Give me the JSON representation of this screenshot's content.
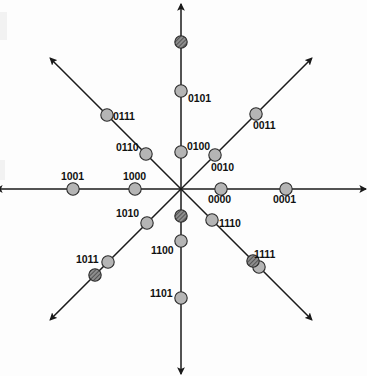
{
  "figure": {
    "kind": "constellation-diagram",
    "title": "",
    "background_color": "#fdfdfd",
    "axis_color": "#1a1a1a",
    "point_fill_light": "#b5b5b5",
    "point_fill_dark": "#6e6e6e",
    "point_stroke": "#2a2a2a",
    "label_color": "#111111",
    "center": {
      "x": 181,
      "y": 189
    },
    "ray_count": 8,
    "ray_angles_deg": [
      0,
      45,
      90,
      135,
      180,
      225,
      270,
      315
    ],
    "ray_length_px": 185
  },
  "chart_data": {
    "type": "scatter",
    "title": "",
    "xlabel": "",
    "ylabel": "",
    "grid": false,
    "legend": null,
    "axis_style": "eight-ray-star-with-arrowheads",
    "points": [
      {
        "label": "0001",
        "angle_deg": 0,
        "radius": 105,
        "x": 286,
        "y": 189,
        "shade": "light",
        "label_dx": -13,
        "label_dy": 11
      },
      {
        "label": "0000",
        "angle_deg": 0,
        "radius": 40,
        "x": 221,
        "y": 189,
        "shade": "light",
        "label_dx": -13,
        "label_dy": 11
      },
      {
        "label": "0011",
        "angle_deg": 45,
        "radius": 106,
        "x": 256,
        "y": 114,
        "shade": "light",
        "label_dx": -3,
        "label_dy": 12
      },
      {
        "label": "0010",
        "angle_deg": 45,
        "radius": 48,
        "x": 215,
        "y": 155,
        "shade": "light",
        "label_dx": -4,
        "label_dy": 13
      },
      {
        "label": "0101",
        "angle_deg": 90,
        "radius": 98,
        "x": 181,
        "y": 91,
        "shade": "light",
        "label_dx": 7,
        "label_dy": 8
      },
      {
        "label": "",
        "angle_deg": 90,
        "radius": 147,
        "x": 181,
        "y": 42,
        "shade": "dark",
        "label_dx": 0,
        "label_dy": 0
      },
      {
        "label": "0100",
        "angle_deg": 90,
        "radius": 37,
        "x": 181,
        "y": 152,
        "shade": "light",
        "label_dx": 6,
        "label_dy": -5
      },
      {
        "label": "0111",
        "angle_deg": 135,
        "radius": 105,
        "x": 107,
        "y": 115,
        "shade": "light",
        "label_dx": 6,
        "label_dy": 2
      },
      {
        "label": "0110",
        "angle_deg": 135,
        "radius": 50,
        "x": 146,
        "y": 154,
        "shade": "light",
        "label_dx": -30,
        "label_dy": -6
      },
      {
        "label": "1001",
        "angle_deg": 180,
        "radius": 108,
        "x": 73,
        "y": 189,
        "shade": "light",
        "label_dx": -12,
        "label_dy": -12
      },
      {
        "label": "1000",
        "angle_deg": 180,
        "radius": 46,
        "x": 135,
        "y": 189,
        "shade": "light",
        "label_dx": -12,
        "label_dy": -12
      },
      {
        "label": "1011",
        "angle_deg": 225,
        "radius": 103,
        "x": 108,
        "y": 262,
        "shade": "light",
        "label_dx": -32,
        "label_dy": -2
      },
      {
        "label": "",
        "angle_deg": 225,
        "radius": 122,
        "x": 95,
        "y": 275,
        "shade": "dark",
        "label_dx": 0,
        "label_dy": 0
      },
      {
        "label": "1010",
        "angle_deg": 225,
        "radius": 48,
        "x": 147,
        "y": 223,
        "shade": "light",
        "label_dx": -31,
        "label_dy": -9
      },
      {
        "label": "1101",
        "angle_deg": 270,
        "radius": 109,
        "x": 181,
        "y": 298,
        "shade": "light",
        "label_dx": -31,
        "label_dy": -4
      },
      {
        "label": "1100",
        "angle_deg": 270,
        "radius": 52,
        "x": 181,
        "y": 241,
        "shade": "light",
        "label_dx": -30,
        "label_dy": 10
      },
      {
        "label": "",
        "angle_deg": 270,
        "radius": 27,
        "x": 181,
        "y": 216,
        "shade": "dark",
        "label_dx": 0,
        "label_dy": 0
      },
      {
        "label": "1111",
        "angle_deg": 315,
        "radius": 110,
        "x": 259,
        "y": 267,
        "shade": "light",
        "label_dx": -5,
        "label_dy": -12
      },
      {
        "label": "",
        "angle_deg": 315,
        "radius": 101,
        "x": 253,
        "y": 261,
        "shade": "dark",
        "label_dx": 0,
        "label_dy": 0
      },
      {
        "label": "1110",
        "angle_deg": 315,
        "radius": 44,
        "x": 212,
        "y": 220,
        "shade": "light",
        "label_dx": 7,
        "label_dy": 4
      }
    ]
  }
}
